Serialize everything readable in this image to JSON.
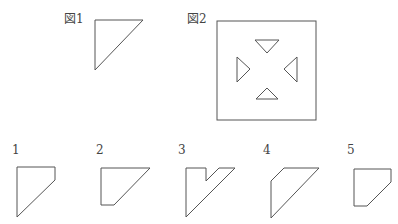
{
  "figures": {
    "fig1": {
      "label": "図1",
      "label_pos": [
        64,
        12
      ],
      "points": "95,20 143,20 95,70"
    },
    "fig2": {
      "label": "図2",
      "label_pos": [
        187,
        12
      ],
      "square": {
        "x": 217,
        "y": 21,
        "w": 99,
        "h": 99
      },
      "triangles": [
        {
          "name": "top-triangle-down",
          "points": "255,40 279,40 267,53"
        },
        {
          "name": "left-triangle-right",
          "points": "237,57 250,69 237,82"
        },
        {
          "name": "right-triangle-left",
          "points": "297,57 284,69 297,82"
        },
        {
          "name": "bottom-triangle-up",
          "points": "256,99 278,99 267,88"
        }
      ]
    }
  },
  "options": [
    {
      "label": "1",
      "label_pos": [
        12,
        143
      ],
      "points": "17,167 55,167 55,180 17,217"
    },
    {
      "label": "2",
      "label_pos": [
        96,
        143
      ],
      "points": "101,168 150,168 114,205 101,205"
    },
    {
      "label": "3",
      "label_pos": [
        178,
        143
      ],
      "points": "186,168 206,168 206,181 219,168 235,168 186,217"
    },
    {
      "label": "4",
      "label_pos": [
        263,
        143
      ],
      "points": "271,181 284,168 319,168 271,218"
    },
    {
      "label": "5",
      "label_pos": [
        347,
        143
      ],
      "points": "354,169 391,169 391,182 367,206 354,206"
    }
  ]
}
